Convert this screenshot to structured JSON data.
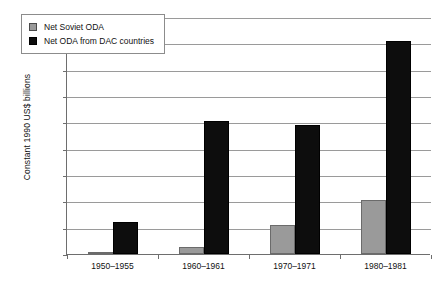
{
  "chart_data": {
    "type": "bar",
    "title": "",
    "subtitle": "",
    "xlabel": "",
    "ylabel": "Constant 1990 US$ billions",
    "categories": [
      "1950–1955",
      "1960–1961",
      "1970–1971",
      "1980–1981"
    ],
    "series": [
      {
        "name": "Net Soviet ODA",
        "color": "#9a9a9a",
        "values": [
          2,
          13,
          55,
          103
        ]
      },
      {
        "name": "Net ODA from DAC countries",
        "color": "#0d0d0d",
        "values": [
          61,
          252,
          245,
          405
        ]
      }
    ],
    "ylim": [
      0,
      450
    ],
    "ytick_step": 50,
    "yticks": [
      0,
      50,
      100,
      150,
      200,
      250,
      300,
      350,
      400,
      450
    ],
    "ytick_labels": [
      "0",
      "50",
      "100",
      "150",
      "200",
      "250",
      "300",
      "350",
      "400",
      "450"
    ],
    "grid": "horizontal",
    "legend_position": "top-left-inside"
  },
  "caption": {
    "text": ""
  }
}
